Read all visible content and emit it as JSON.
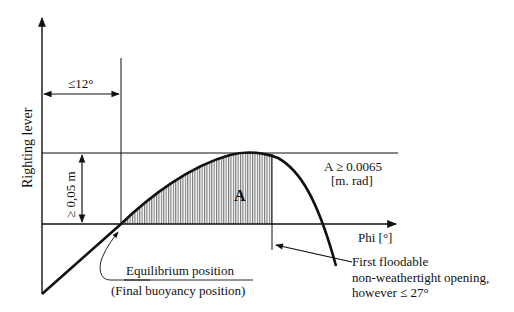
{
  "diagram": {
    "y_axis_label": "Righting lever",
    "x_axis_label": "Phi [°]",
    "angle_annotation": "≤12°",
    "height_annotation": "≥ 0,05 m",
    "area_label": "A",
    "area_criterion_line1": "A ≥ 0.0065",
    "area_criterion_line2": "[m. rad]",
    "equilibrium_label": "Equilibrium position",
    "equilibrium_sublabel": "(Final buoyancy position)",
    "opening_line1": "First floodable",
    "opening_line2": "non-weathertight opening,",
    "opening_line3": "however ≤ 27°",
    "colors": {
      "ink": "#111111",
      "background": "#ffffff",
      "hatch": "#555555"
    }
  }
}
